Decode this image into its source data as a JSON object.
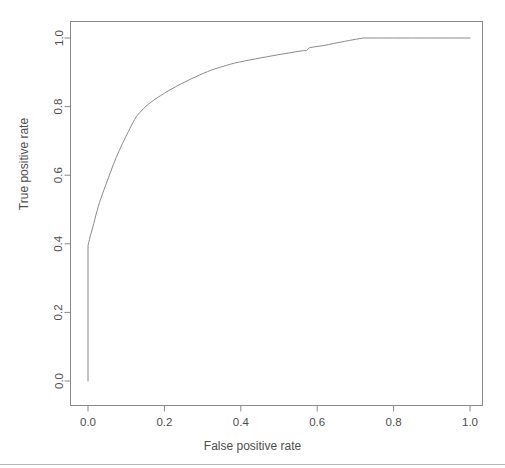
{
  "chart_data": {
    "type": "line",
    "title": "",
    "xlabel": "False positive rate",
    "ylabel": "True positive rate",
    "xlim": [
      0.0,
      1.0
    ],
    "ylim": [
      0.0,
      1.0
    ],
    "grid": false,
    "legend": null,
    "line_color": "#8a8a8a",
    "background_color": "#ffffff",
    "frame_color": "#8a8a8a",
    "xticks": [
      0.0,
      0.2,
      0.4,
      0.6,
      0.8,
      1.0
    ],
    "xtick_labels": [
      "0.0",
      "0.2",
      "0.4",
      "0.6",
      "0.8",
      "1.0"
    ],
    "yticks": [
      0.0,
      0.2,
      0.4,
      0.6,
      0.8,
      1.0
    ],
    "ytick_labels": [
      "0.0",
      "0.2",
      "0.4",
      "0.6",
      "0.8",
      "1.0"
    ],
    "series": [
      {
        "name": "ROC curve",
        "x": [
          0.0,
          0.0,
          0.002,
          0.004,
          0.006,
          0.009,
          0.012,
          0.015,
          0.018,
          0.021,
          0.024,
          0.027,
          0.03,
          0.034,
          0.038,
          0.042,
          0.046,
          0.05,
          0.054,
          0.058,
          0.062,
          0.066,
          0.07,
          0.074,
          0.078,
          0.082,
          0.086,
          0.09,
          0.094,
          0.098,
          0.102,
          0.106,
          0.11,
          0.114,
          0.118,
          0.122,
          0.126,
          0.131,
          0.136,
          0.141,
          0.146,
          0.152,
          0.158,
          0.164,
          0.17,
          0.176,
          0.183,
          0.19,
          0.197,
          0.204,
          0.212,
          0.22,
          0.228,
          0.236,
          0.245,
          0.254,
          0.263,
          0.272,
          0.282,
          0.292,
          0.302,
          0.313,
          0.324,
          0.335,
          0.347,
          0.359,
          0.371,
          0.384,
          0.397,
          0.41,
          0.424,
          0.438,
          0.452,
          0.467,
          0.482,
          0.497,
          0.513,
          0.529,
          0.545,
          0.562,
          0.572,
          0.58,
          0.592,
          0.604,
          0.617,
          0.63,
          0.643,
          0.657,
          0.671,
          0.685,
          0.7,
          0.715,
          0.72,
          0.76,
          0.8,
          0.85,
          0.9,
          0.95,
          1.0
        ],
        "y": [
          0.0,
          0.395,
          0.404,
          0.413,
          0.423,
          0.434,
          0.446,
          0.459,
          0.472,
          0.485,
          0.497,
          0.509,
          0.52,
          0.533,
          0.546,
          0.558,
          0.57,
          0.582,
          0.594,
          0.606,
          0.618,
          0.63,
          0.641,
          0.652,
          0.662,
          0.672,
          0.682,
          0.692,
          0.701,
          0.71,
          0.719,
          0.728,
          0.737,
          0.746,
          0.754,
          0.762,
          0.77,
          0.777,
          0.783,
          0.789,
          0.795,
          0.801,
          0.807,
          0.812,
          0.817,
          0.822,
          0.827,
          0.832,
          0.837,
          0.842,
          0.847,
          0.852,
          0.857,
          0.862,
          0.867,
          0.872,
          0.877,
          0.882,
          0.887,
          0.892,
          0.897,
          0.902,
          0.907,
          0.911,
          0.915,
          0.919,
          0.923,
          0.927,
          0.93,
          0.933,
          0.936,
          0.939,
          0.942,
          0.945,
          0.948,
          0.951,
          0.954,
          0.957,
          0.96,
          0.963,
          0.963,
          0.972,
          0.974,
          0.976,
          0.978,
          0.981,
          0.984,
          0.987,
          0.99,
          0.993,
          0.996,
          0.999,
          1.0,
          1.0,
          1.0,
          1.0,
          1.0,
          1.0,
          1.0
        ]
      }
    ]
  }
}
